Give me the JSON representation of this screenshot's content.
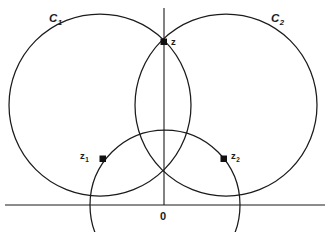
{
  "figure": {
    "kind": "geometry-diagram",
    "background_color": "#ffffff",
    "stroke_color": "#1b1b1b",
    "labels": {
      "c1": {
        "text": "C",
        "subscript": "1"
      },
      "c2": {
        "text": "C",
        "subscript": "2"
      },
      "z": {
        "text": "z",
        "subscript": ""
      },
      "z1": {
        "text": "z",
        "subscript": "1"
      },
      "z2": {
        "text": "z",
        "subscript": "2"
      },
      "origin": {
        "text": "0",
        "subscript": ""
      }
    },
    "axes": {
      "horizontal": {
        "y": 205,
        "x_start": 5,
        "x_end": 325
      },
      "vertical": {
        "x": 164,
        "y_start": 8,
        "y_end": 205
      }
    },
    "circles": [
      {
        "name": "C1",
        "cx": 100,
        "cy": 105,
        "r": 91
      },
      {
        "name": "C2",
        "cx": 226,
        "cy": 105,
        "r": 91
      },
      {
        "name": "inner-circle",
        "cx": 165,
        "cy": 205,
        "r": 75
      }
    ],
    "points": [
      {
        "name": "z",
        "x": 164,
        "y": 42,
        "marker": "filled-square"
      },
      {
        "name": "z1",
        "x": 103,
        "y": 159,
        "marker": "filled-square"
      },
      {
        "name": "z2",
        "x": 224,
        "y": 159,
        "marker": "filled-square"
      }
    ]
  }
}
